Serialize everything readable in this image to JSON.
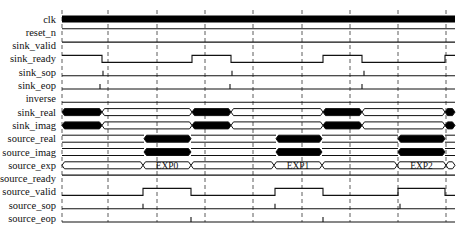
{
  "diagram": {
    "type": "timing-diagram",
    "x_start": 62,
    "x_end": 455,
    "dashed_guides_x": [
      108,
      157,
      205,
      253,
      302,
      350,
      398,
      446
    ],
    "signals": [
      {
        "name": "clk",
        "kind": "clock"
      },
      {
        "name": "reset_n",
        "kind": "bit",
        "segments": [
          [
            62,
            455,
            1
          ]
        ]
      },
      {
        "name": "sink_valid",
        "kind": "bit",
        "segments": [
          [
            62,
            455,
            1
          ]
        ]
      },
      {
        "name": "sink_ready",
        "kind": "bit",
        "segments": [
          [
            62,
            102,
            1
          ],
          [
            102,
            192,
            0
          ],
          [
            192,
            231,
            1
          ],
          [
            231,
            323,
            0
          ],
          [
            323,
            362,
            1
          ],
          [
            362,
            445,
            0
          ],
          [
            445,
            455,
            1
          ]
        ]
      },
      {
        "name": "sink_sop",
        "kind": "pulse",
        "pulses": [
          103,
          232,
          364
        ]
      },
      {
        "name": "sink_eop",
        "kind": "pulse",
        "pulses": [
          100,
          230,
          362
        ]
      },
      {
        "name": "inverse",
        "kind": "bit",
        "segments": [
          [
            62,
            455,
            0
          ]
        ]
      },
      {
        "name": "sink_real",
        "kind": "bus",
        "segments": [
          [
            62,
            102,
            "busy",
            ""
          ],
          [
            102,
            192,
            "idle",
            ""
          ],
          [
            192,
            231,
            "busy",
            ""
          ],
          [
            231,
            323,
            "idle",
            ""
          ],
          [
            323,
            362,
            "busy",
            ""
          ],
          [
            362,
            445,
            "idle",
            ""
          ],
          [
            445,
            455,
            "busy",
            ""
          ]
        ]
      },
      {
        "name": "sink_imag",
        "kind": "bus",
        "segments": [
          [
            62,
            102,
            "busy",
            ""
          ],
          [
            102,
            192,
            "idle",
            ""
          ],
          [
            192,
            231,
            "busy",
            ""
          ],
          [
            231,
            323,
            "idle",
            ""
          ],
          [
            323,
            362,
            "busy",
            ""
          ],
          [
            362,
            445,
            "idle",
            ""
          ],
          [
            445,
            455,
            "busy",
            ""
          ]
        ]
      },
      {
        "name": "source_real",
        "kind": "bus",
        "segments": [
          [
            62,
            144,
            "flat",
            ""
          ],
          [
            144,
            191,
            "busy",
            ""
          ],
          [
            191,
            276,
            "flat",
            ""
          ],
          [
            276,
            322,
            "busy",
            ""
          ],
          [
            322,
            398,
            "flat",
            ""
          ],
          [
            398,
            445,
            "busy",
            ""
          ],
          [
            445,
            455,
            "flat",
            ""
          ]
        ]
      },
      {
        "name": "source_imag",
        "kind": "bus",
        "segments": [
          [
            62,
            144,
            "flat",
            ""
          ],
          [
            144,
            191,
            "busy",
            ""
          ],
          [
            191,
            276,
            "flat",
            ""
          ],
          [
            276,
            322,
            "busy",
            ""
          ],
          [
            322,
            398,
            "flat",
            ""
          ],
          [
            398,
            445,
            "busy",
            ""
          ],
          [
            445,
            455,
            "flat",
            ""
          ]
        ]
      },
      {
        "name": "source_exp",
        "kind": "bus",
        "segments": [
          [
            62,
            143,
            "idle",
            ""
          ],
          [
            143,
            191,
            "idle",
            "EXP0"
          ],
          [
            191,
            274,
            "idle",
            ""
          ],
          [
            274,
            322,
            "idle",
            "EXP1"
          ],
          [
            322,
            397,
            "idle",
            ""
          ],
          [
            397,
            446,
            "idle",
            "EXP2"
          ],
          [
            446,
            455,
            "idle",
            ""
          ]
        ]
      },
      {
        "name": "source_ready",
        "kind": "bit",
        "segments": [
          [
            62,
            455,
            1
          ]
        ]
      },
      {
        "name": "source_valid",
        "kind": "bit",
        "segments": [
          [
            62,
            143,
            0
          ],
          [
            143,
            191,
            1
          ],
          [
            191,
            275,
            0
          ],
          [
            275,
            323,
            1
          ],
          [
            323,
            398,
            0
          ],
          [
            398,
            445,
            1
          ],
          [
            445,
            455,
            0
          ]
        ]
      },
      {
        "name": "source_sop",
        "kind": "pulse",
        "pulses": [
          143,
          275,
          400
        ]
      },
      {
        "name": "source_eop",
        "kind": "pulse",
        "pulses": [
          191,
          323
        ]
      }
    ],
    "colors": {
      "line": "#111111",
      "fill": "#000000",
      "guide": "#333333",
      "background": "#ffffff"
    }
  }
}
